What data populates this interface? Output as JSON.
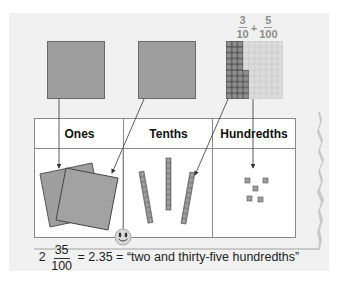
{
  "diagram": {
    "top_fraction": {
      "term1": {
        "numerator": "3",
        "denominator": "10"
      },
      "operator": "+",
      "term2": {
        "numerator": "5",
        "denominator": "100"
      }
    },
    "blocks": [
      {
        "name": "ones-flat",
        "description": "one whole square"
      },
      {
        "name": "tenths-flat",
        "description": "one whole square"
      },
      {
        "name": "hundredths-grid",
        "description": "10x10 grid with 3 columns and 5 cells shaded"
      }
    ],
    "table": {
      "headers": [
        "Ones",
        "Tenths",
        "Hundredths"
      ],
      "ones_count": 2,
      "tenths_count": 3,
      "hundredths_count": 5
    },
    "equation": {
      "whole": "2",
      "numerator": "35",
      "denominator": "100",
      "decimal_part": "= 2.35 =",
      "words": "“two and thirty-five hundredths”"
    },
    "colors": {
      "block_fill": "#9e9e9e",
      "block_border": "#6a6a6a",
      "grid_light": "#dcdcdc",
      "panel_bg": "#f1f1f1"
    }
  }
}
